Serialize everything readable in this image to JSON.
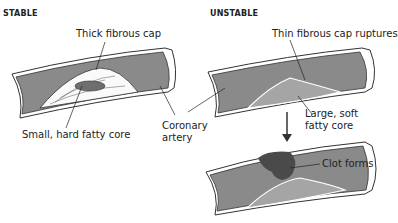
{
  "panels": {
    "stable": {
      "heading": "STABLE",
      "labels": {
        "cap": "Thick fibrous cap",
        "core": "Small, hard fatty core"
      }
    },
    "unstable": {
      "heading": "UNSTABLE",
      "labels": {
        "cap": "Thin fibrous cap ruptures",
        "core_line1": "Large, soft",
        "core_line2": "fatty core",
        "clot": "Clot forms"
      }
    },
    "shared": {
      "artery_line1": "Coronary",
      "artery_line2": "artery"
    }
  },
  "colors": {
    "lumen": "#8a8a8a",
    "wall": "#ffffff",
    "outline": "#333333",
    "core": "#6e6e6e",
    "plaque": "#a5a5a5",
    "clot": "#4a4a4a"
  }
}
